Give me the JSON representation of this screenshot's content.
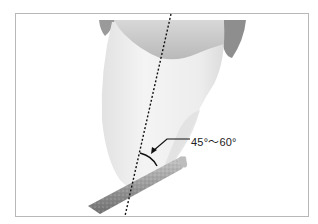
{
  "figure": {
    "angle_label": "45°～60°",
    "colors": {
      "frame": "#b8b8b8",
      "tooth_body": "#ececec",
      "tooth_shadow": "#bdbdbd",
      "gingiva_dark": "#8e8e8e",
      "bur": "#9a9a9a",
      "axis_line": "#111111"
    }
  }
}
